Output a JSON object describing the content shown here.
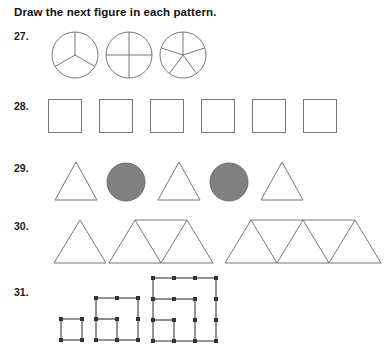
{
  "worksheet": {
    "instruction": "Draw the next figure in each pattern.",
    "accent_gray": "#808080",
    "line_color": "#777777",
    "dot_color": "#333333",
    "problems": [
      {
        "number": "27.",
        "pattern_name": "divided-circles",
        "description": "Circles divided into an increasing number of equal sectors",
        "figures": [
          {
            "shape": "circle",
            "sectors": 3,
            "fill": "none"
          },
          {
            "shape": "circle",
            "sectors": 4,
            "fill": "none"
          },
          {
            "shape": "circle",
            "sectors": 5,
            "fill": "none"
          }
        ],
        "next_figure": "circle divided into 6 equal sectors"
      },
      {
        "number": "28.",
        "pattern_name": "square-row",
        "description": "A row of identical empty squares",
        "figures": [
          {
            "shape": "square",
            "fill": "none"
          },
          {
            "shape": "square",
            "fill": "none"
          },
          {
            "shape": "square",
            "fill": "none"
          },
          {
            "shape": "square",
            "fill": "none"
          },
          {
            "shape": "square",
            "fill": "none"
          },
          {
            "shape": "square",
            "fill": "none"
          }
        ],
        "next_figure": "another identical square"
      },
      {
        "number": "29.",
        "pattern_name": "triangle-circle-alternating",
        "description": "Alternating white triangle and gray filled circle",
        "figures": [
          {
            "shape": "triangle",
            "fill": "none"
          },
          {
            "shape": "circle",
            "fill": "#808080"
          },
          {
            "shape": "triangle",
            "fill": "none"
          },
          {
            "shape": "circle",
            "fill": "#808080"
          },
          {
            "shape": "triangle",
            "fill": "none"
          }
        ],
        "next_figure": "gray filled circle"
      },
      {
        "number": "30.",
        "pattern_name": "growing-triangle-trapezoid",
        "description": "Trapezoids built from an odd number of small triangles",
        "figures": [
          {
            "shape": "triangle-group",
            "triangle_count": 1,
            "fill": "none"
          },
          {
            "shape": "triangle-group",
            "triangle_count": 3,
            "fill": "none"
          },
          {
            "shape": "triangle-group",
            "triangle_count": 5,
            "fill": "none"
          }
        ],
        "next_figure": "trapezoid made of 7 small triangles"
      },
      {
        "number": "31.",
        "pattern_name": "nested-squares-grid",
        "description": "Nested square outlines on a dot grid, growing by one unit",
        "figures": [
          {
            "shape": "nested-squares",
            "size": 1,
            "fill": "none"
          },
          {
            "shape": "nested-squares",
            "size": 2,
            "fill": "none"
          },
          {
            "shape": "nested-squares",
            "size": 3,
            "fill": "none"
          }
        ],
        "next_figure": "nested squares of size 4"
      }
    ]
  }
}
